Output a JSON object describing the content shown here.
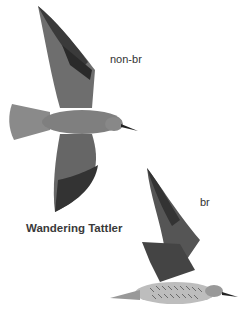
{
  "species_name": "Wandering Tattler",
  "figures": [
    {
      "label": "non-br",
      "description": "bird in flight, dorsal view, gray plumage, wings spread"
    },
    {
      "label": "br",
      "description": "bird in flight, side view, barred underparts"
    }
  ],
  "colors": {
    "background": "#ffffff",
    "plumage_gray": "#7a7a7a",
    "wingtip_dark": "#2e2e2e",
    "text": "#333333"
  }
}
